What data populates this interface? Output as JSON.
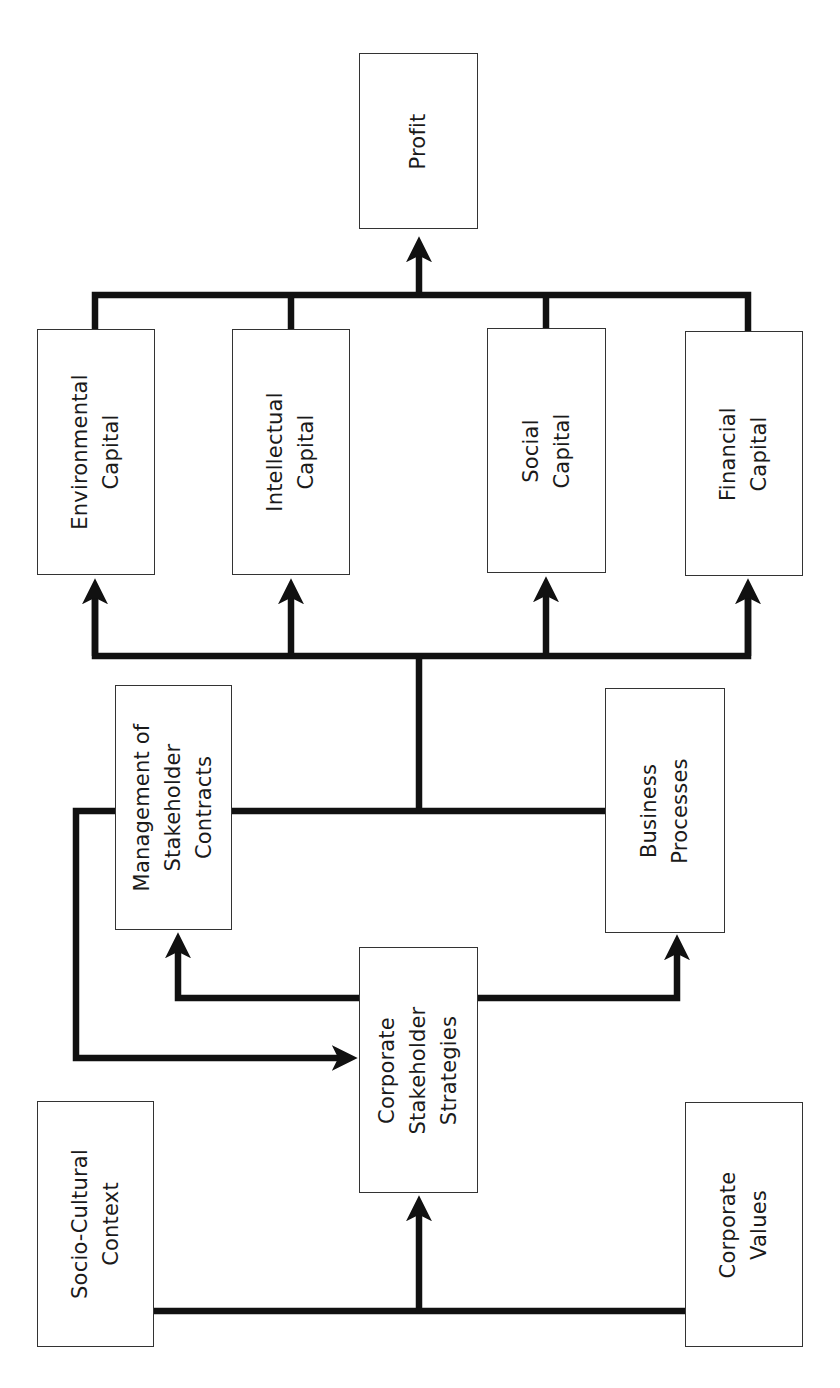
{
  "diagram": {
    "orientation": "rotated-90-ccw",
    "colors": {
      "background": "#ffffff",
      "box_border": "#333333",
      "connector": "#111111",
      "text": "#1a1a1a"
    },
    "nodes": {
      "profit": {
        "label": "Profit"
      },
      "environmental_capital": {
        "label": "Environmental\nCapital"
      },
      "intellectual_capital": {
        "label": "Intellectual\nCapital"
      },
      "social_capital": {
        "label": "Social\nCapital"
      },
      "financial_capital": {
        "label": "Financial\nCapital"
      },
      "management_stakeholder_contracts": {
        "label": "Management of\nStakeholder\nContracts"
      },
      "business_processes": {
        "label": "Business\nProcesses"
      },
      "corporate_stakeholder_strategies": {
        "label": "Corporate\nStakeholder\nStrategies"
      },
      "socio_cultural_context": {
        "label": "Socio-Cultural\nContext"
      },
      "corporate_values": {
        "label": "Corporate\nValues"
      }
    },
    "edges": [
      {
        "from": "Socio-Cultural Context",
        "to": "Corporate Stakeholder Strategies"
      },
      {
        "from": "Corporate Values",
        "to": "Corporate Stakeholder Strategies"
      },
      {
        "from": "Corporate Stakeholder Strategies",
        "to": "Management of Stakeholder Contracts"
      },
      {
        "from": "Corporate Stakeholder Strategies",
        "to": "Business Processes"
      },
      {
        "from": "Management of Stakeholder Contracts",
        "to": "Corporate Stakeholder Strategies"
      },
      {
        "from": "Management of Stakeholder Contracts",
        "to": "Environmental Capital"
      },
      {
        "from": "Management of Stakeholder Contracts",
        "to": "Intellectual Capital"
      },
      {
        "from": "Management of Stakeholder Contracts",
        "to": "Social Capital"
      },
      {
        "from": "Management of Stakeholder Contracts",
        "to": "Financial Capital"
      },
      {
        "from": "Business Processes",
        "to": "Environmental Capital"
      },
      {
        "from": "Business Processes",
        "to": "Intellectual Capital"
      },
      {
        "from": "Business Processes",
        "to": "Social Capital"
      },
      {
        "from": "Business Processes",
        "to": "Financial Capital"
      },
      {
        "from": "Environmental Capital",
        "to": "Profit"
      },
      {
        "from": "Intellectual Capital",
        "to": "Profit"
      },
      {
        "from": "Social Capital",
        "to": "Profit"
      },
      {
        "from": "Financial Capital",
        "to": "Profit"
      }
    ]
  }
}
